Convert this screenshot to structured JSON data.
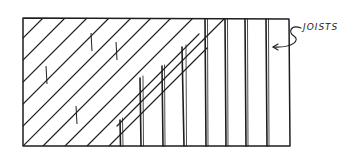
{
  "diagram": {
    "label": "JOISTS",
    "colors": {
      "ink": "#1e1e1e",
      "background": "#ffffff"
    },
    "frame": {
      "x1": 23,
      "y1": 18,
      "x2": 290,
      "y2": 146
    },
    "diagonal_boards": {
      "description": "diagonal subfloor boards laid over the left portion",
      "spacing": 20,
      "angle_deg": 45
    },
    "joists_x": [
      120,
      141,
      162,
      184,
      205,
      226,
      247,
      267
    ],
    "board_seams": [
      {
        "x": 46,
        "y1": 66,
        "y2": 84
      },
      {
        "x": 91,
        "y1": 33,
        "y2": 51
      },
      {
        "x": 116,
        "y1": 42,
        "y2": 60
      },
      {
        "x": 76,
        "y1": 106,
        "y2": 124
      }
    ],
    "callout": {
      "text_x": 300,
      "text_y": 32,
      "arrow_tip_x": 270,
      "arrow_tip_y": 48
    }
  }
}
